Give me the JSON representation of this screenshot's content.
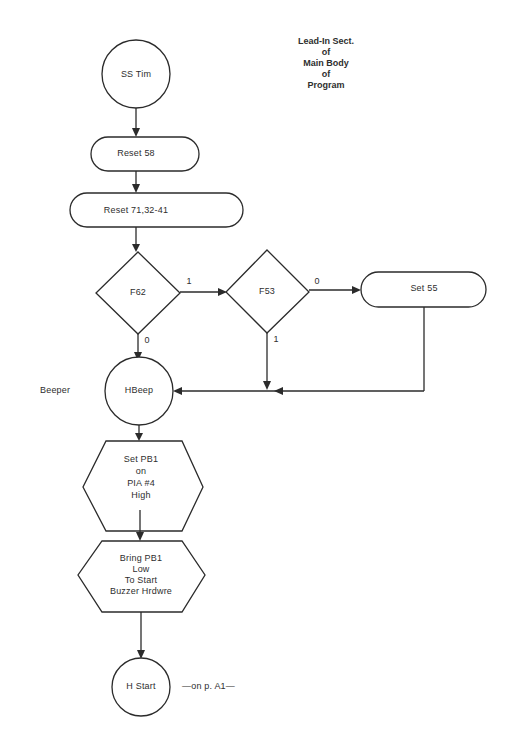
{
  "title": {
    "lines": [
      "Lead-In Sect.",
      "of",
      "Main Body",
      "of",
      "Program"
    ]
  },
  "nodes": {
    "ss_tim": {
      "type": "terminal-circle",
      "label": "SS Tim"
    },
    "reset_58": {
      "type": "process-rounded",
      "label": "Reset 58"
    },
    "reset_71": {
      "type": "process-rounded",
      "label": "Reset 71,32-41"
    },
    "f62": {
      "type": "decision",
      "label": "F62"
    },
    "f53": {
      "type": "decision",
      "label": "F53"
    },
    "set_55": {
      "type": "process-rounded",
      "label": "Set 55"
    },
    "hbeep": {
      "type": "connector-circle",
      "label": "HBeep",
      "side_label": "Beeper"
    },
    "set_pb1": {
      "type": "preparation-hexagon",
      "lines": [
        "Set PB1",
        "on",
        "PIA #4",
        "High"
      ]
    },
    "bring_pb1": {
      "type": "preparation-hexagon",
      "lines": [
        "Bring PB1",
        "Low",
        "To Start",
        "Buzzer Hrdwre"
      ]
    },
    "h_start": {
      "type": "connector-circle",
      "label": "H Start",
      "side_label": "—on p. A1—"
    }
  },
  "edges": {
    "f62_yes": "1",
    "f62_no": "0",
    "f53_yes": "1",
    "f53_no": "0"
  }
}
